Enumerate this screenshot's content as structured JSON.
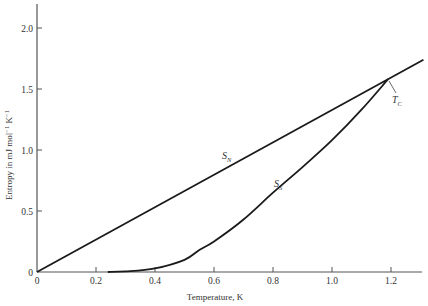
{
  "chart_data": {
    "type": "line",
    "title": "",
    "xlabel": "Temperature, K",
    "ylabel": "Entropy in mJ mol⁻¹ K⁻¹",
    "ylabel_parts": {
      "main": "Entropy in mJ mol",
      "sup1": "−1",
      "mid": " K",
      "sup2": "−1"
    },
    "xlim": [
      0,
      1.31
    ],
    "ylim": [
      0,
      2.2
    ],
    "x_ticks": [
      0,
      0.2,
      0.4,
      0.6,
      0.8,
      1.0,
      1.2
    ],
    "x_tick_labels": [
      "0",
      "0.2",
      "0.4",
      "0.6",
      "0.8",
      "1.0",
      "1.2"
    ],
    "y_ticks": [
      0,
      0.5,
      1.0,
      1.5,
      2.0
    ],
    "y_tick_labels": [
      "0",
      "0.5",
      "1.0",
      "1.5",
      "2.0"
    ],
    "grid": false,
    "legend": "none (inline curve labels)",
    "series": [
      {
        "name": "S_N",
        "label_main": "S",
        "label_sub": "N",
        "description": "Normal-state entropy (linear)",
        "x": [
          0,
          0.2,
          0.4,
          0.6,
          0.8,
          1.0,
          1.19,
          1.31
        ],
        "values": [
          0,
          0.27,
          0.53,
          0.8,
          1.07,
          1.33,
          1.58,
          1.74
        ]
      },
      {
        "name": "S_S",
        "label_main": "S",
        "label_sub": "S",
        "description": "Superconducting-state entropy",
        "x": [
          0.24,
          0.3,
          0.4,
          0.5,
          0.55,
          0.6,
          0.7,
          0.8,
          0.9,
          1.0,
          1.1,
          1.19
        ],
        "values": [
          0,
          0.005,
          0.03,
          0.1,
          0.18,
          0.25,
          0.43,
          0.65,
          0.86,
          1.08,
          1.33,
          1.58
        ]
      }
    ],
    "annotations": [
      {
        "text_main": "T",
        "text_sub": "C",
        "points_to": [
          1.19,
          1.58
        ],
        "description": "Critical temperature where S_S meets S_N"
      }
    ]
  }
}
